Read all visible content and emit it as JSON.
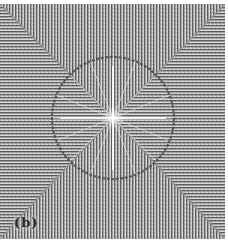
{
  "figure": {
    "panel_label": "(b)",
    "colors": {
      "background": "#ffffff",
      "stripe_dark": "#5a5a5a",
      "stripe_light": "#d8d8d8",
      "base_gray": "#9a9a9a",
      "ring": "#4a4a4a",
      "center_glow": "#ffffff"
    },
    "geometry": {
      "ring_center_x": 113,
      "ring_center_y": 114,
      "ring_radius": 61,
      "stripe_period_px": 3
    },
    "regions": [
      {
        "name": "top",
        "stripe_orientation": "vertical"
      },
      {
        "name": "bottom",
        "stripe_orientation": "vertical"
      },
      {
        "name": "left",
        "stripe_orientation": "horizontal"
      },
      {
        "name": "right",
        "stripe_orientation": "horizontal"
      }
    ]
  }
}
